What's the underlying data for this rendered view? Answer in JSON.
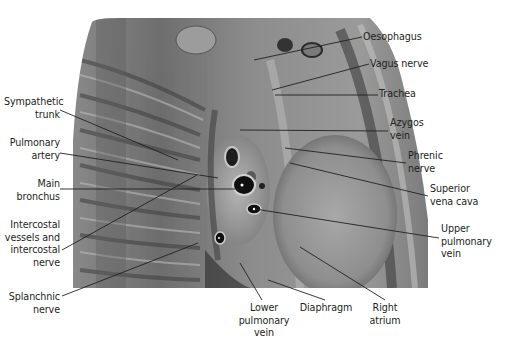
{
  "figure": {
    "photo_bounds": {
      "x": 73,
      "y": 18,
      "width": 352,
      "height": 270
    },
    "colors": {
      "text": "#231f20",
      "leader": "#231f20",
      "background": "#ffffff"
    }
  },
  "labels": {
    "left": [
      {
        "id": "sympathetic-trunk",
        "text": "Sympathetic\ntrunk",
        "x": 4,
        "y": 96,
        "w": 56,
        "line": [
          60,
          110,
          178,
          160
        ]
      },
      {
        "id": "pulmonary-artery",
        "text": "Pulmonary\nartery",
        "x": 4,
        "y": 137,
        "w": 56,
        "line": [
          60,
          153,
          218,
          178
        ]
      },
      {
        "id": "main-bronchus",
        "text": "Main\nbronchus",
        "x": 4,
        "y": 178,
        "w": 56,
        "line": [
          60,
          189,
          244,
          189
        ]
      },
      {
        "id": "intercostal-vessels-nerve",
        "text": "Intercostal\nvessels and\nintercostal\nnerve",
        "x": 4,
        "y": 219,
        "w": 56,
        "line": [
          62,
          250,
          197,
          175
        ]
      },
      {
        "id": "splanchnic-nerve",
        "text": "Splanchnic\nnerve",
        "x": 4,
        "y": 291,
        "w": 56,
        "line": [
          62,
          296,
          198,
          243
        ]
      }
    ],
    "right": [
      {
        "id": "oesophagus",
        "text": "Oesophagus",
        "x": 363,
        "y": 31,
        "line": [
          362,
          37,
          254,
          60
        ]
      },
      {
        "id": "vagus-nerve",
        "text": "Vagus nerve",
        "x": 370,
        "y": 58,
        "line": [
          369,
          64,
          272,
          90
        ]
      },
      {
        "id": "trachea",
        "text": "Trachea",
        "x": 379,
        "y": 88,
        "line": [
          378,
          95,
          275,
          95
        ]
      },
      {
        "id": "azygos-vein",
        "text": "Azygos\nvein",
        "x": 390,
        "y": 117,
        "line": [
          388,
          131,
          240,
          130
        ]
      },
      {
        "id": "phrenic-nerve",
        "text": "Phrenic\nnerve",
        "x": 408,
        "y": 150,
        "line": [
          406,
          163,
          285,
          148
        ]
      },
      {
        "id": "superior-vena-cava",
        "text": "Superior\nvena cava",
        "x": 430,
        "y": 183,
        "line": [
          428,
          196,
          290,
          163
        ]
      },
      {
        "id": "upper-pulmonary-vein",
        "text": "Upper\npulmonary\nvein",
        "x": 441,
        "y": 223,
        "line": [
          439,
          238,
          255,
          209
        ]
      },
      {
        "id": "right-atrium",
        "text": "Right\natrium",
        "x": 371,
        "y": 302,
        "line": [
          385,
          300,
          300,
          247
        ],
        "align": "center",
        "w": 44
      }
    ],
    "bottom": [
      {
        "id": "lower-pulmonary-vein",
        "text": "Lower\npulmonary\nvein",
        "x": 238,
        "y": 302,
        "w": 56,
        "line": [
          262,
          300,
          240,
          263
        ]
      },
      {
        "id": "diaphragm",
        "text": "Diaphragm",
        "x": 303,
        "y": 302,
        "w": 56,
        "line": [
          325,
          300,
          268,
          280
        ]
      }
    ]
  }
}
